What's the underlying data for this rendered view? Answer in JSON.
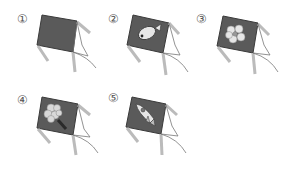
{
  "figure": {
    "colors": {
      "kite_fill": "#5a5a5a",
      "kite_edge": "#3a3a3a",
      "string": "#777777",
      "tail": "#cfcfcf",
      "motif": "#e6e6e6"
    },
    "items": [
      {
        "label": "①",
        "motif": "none"
      },
      {
        "label": "②",
        "motif": "fish"
      },
      {
        "label": "③",
        "motif": "flower"
      },
      {
        "label": "④",
        "motif": "tree"
      },
      {
        "label": "⑤",
        "motif": "rocket"
      }
    ]
  }
}
